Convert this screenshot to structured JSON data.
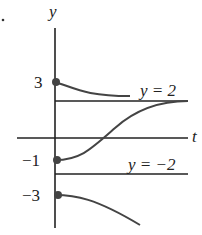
{
  "figure": {
    "bullet": "•",
    "axes": {
      "vertical_label": "y",
      "horizontal_label": "t"
    },
    "tick_labels": [
      "3",
      "−1",
      "−3"
    ],
    "equilibria": [
      {
        "label": "y = 2",
        "value": 2
      },
      {
        "label": "y = −2",
        "value": -2
      }
    ],
    "solutions": [
      {
        "initial_value": 3,
        "behavior": "decreases toward y = 2"
      },
      {
        "initial_value": -1,
        "behavior": "increases toward y = 2"
      },
      {
        "initial_value": -3,
        "behavior": "decreases without bound"
      }
    ],
    "colors": {
      "axis": "#222222",
      "curve": "#444444",
      "point": "#444444"
    }
  }
}
